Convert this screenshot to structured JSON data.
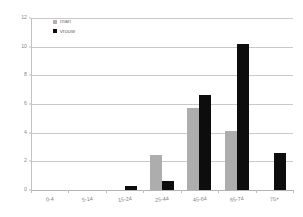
{
  "chart_data": {
    "type": "bar",
    "title": "",
    "subtitle": "",
    "xlabel": "",
    "ylabel": "",
    "categories": [
      "0-4",
      "5-14",
      "15-24",
      "25-44",
      "45-64",
      "65-74",
      "75+"
    ],
    "series": [
      {
        "name": "man",
        "color": "#adadad",
        "values": [
          0,
          0,
          0,
          2.45,
          5.75,
          4.15,
          0
        ]
      },
      {
        "name": "vrouw",
        "color": "#0d0d0d",
        "values": [
          0,
          0,
          0.3,
          0.65,
          6.6,
          10.2,
          2.6
        ]
      }
    ],
    "ylim": [
      0,
      12
    ],
    "yticks": [
      0,
      2,
      4,
      6,
      8,
      10,
      12
    ],
    "ytick_labels": [
      "0",
      "2",
      "4",
      "6",
      "8",
      "10",
      "12"
    ],
    "grid": true,
    "grid_axis": "y",
    "legend_position": "top-left",
    "orientation": "vertical",
    "grouping": "grouped"
  },
  "legend": {
    "items": [
      {
        "label": "man",
        "marker": "square-marker-gray"
      },
      {
        "label": "vrouw",
        "marker": "square-marker-black"
      }
    ]
  },
  "colors": {
    "man": "#adadad",
    "vrouw": "#0d0d0d",
    "gridline": "#c9c9c9",
    "axis": "#b4b4b4",
    "tick_text": "#8a8a8a",
    "background": "#ffffff"
  }
}
